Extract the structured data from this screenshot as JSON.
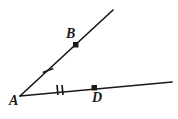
{
  "figure": {
    "background_color": "#ffffff",
    "stroke_color": "#1a1a1a",
    "labels": {
      "vertex": "A",
      "upper_point": "B",
      "lower_point": "D"
    },
    "points": [
      {
        "name": "A",
        "label": "A",
        "x": 20,
        "y": 96,
        "dot": false
      },
      {
        "name": "B",
        "label": "B",
        "x": 76,
        "y": 45,
        "dot": true
      },
      {
        "name": "D",
        "label": "D",
        "x": 94,
        "y": 88,
        "dot": true
      }
    ],
    "rays": [
      {
        "name": "ray-AB",
        "from": "A",
        "through": "B",
        "x1": 20,
        "y1": 96,
        "x2": 113,
        "y2": 10
      },
      {
        "name": "ray-AD",
        "from": "A",
        "through": "D",
        "x1": 20,
        "y1": 96,
        "x2": 172,
        "y2": 82
      }
    ],
    "tick_marks": [
      {
        "name": "tick-AB",
        "segment": "AB",
        "count": 1,
        "x": 48,
        "y": 70
      },
      {
        "name": "tick-AD",
        "segment": "AD",
        "count": 2,
        "x": 60,
        "y": 90
      }
    ]
  }
}
